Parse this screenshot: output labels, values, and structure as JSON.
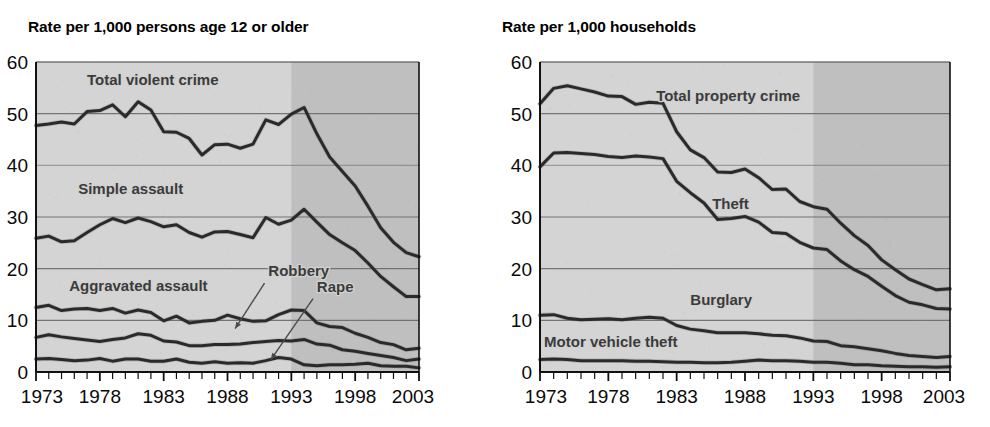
{
  "panels": [
    {
      "id": "left",
      "title": "Rate per 1,000 persons age 12 or older",
      "ylabels": [
        "0",
        "10",
        "20",
        "30",
        "40",
        "50",
        "60"
      ],
      "xlabels": [
        "1973",
        "1978",
        "1983",
        "1988",
        "1993",
        "1998",
        "2003"
      ],
      "series_labels": {
        "total_violent": "Total violent crime",
        "simple_assault": "Simple assault",
        "aggravated_assault": "Aggravated assault",
        "robbery": "Robbery",
        "rape": "Rape"
      }
    },
    {
      "id": "right",
      "title": "Rate per 1,000 households",
      "ylabels": [
        "0",
        "10",
        "20",
        "30",
        "40",
        "50",
        "60"
      ],
      "xlabels": [
        "1973",
        "1978",
        "1983",
        "1988",
        "1993",
        "1998",
        "2003"
      ],
      "series_labels": {
        "total_property": "Total property crime",
        "theft": "Theft",
        "burglary": "Burglary",
        "motor_vehicle_theft": "Motor vehicle theft"
      }
    }
  ],
  "colors": {
    "plot_background": "#d4d4d4",
    "plot_background_shaded": "#bfbfbf",
    "line": "#2a2a2a",
    "gridline": "#6f6f6f",
    "axis": "#111111",
    "label_text": "#3b3b3b",
    "tick_text": "#0a0a0a"
  },
  "chart_data": [
    {
      "type": "line",
      "title": "Rate per 1,000 persons age 12 or older",
      "xlabel": "",
      "ylabel": "Rate per 1,000 persons age 12 or older",
      "xlim": [
        1973,
        2003
      ],
      "ylim": [
        0,
        60
      ],
      "xticks": [
        1973,
        1978,
        1983,
        1988,
        1993,
        1998,
        2003
      ],
      "yticks": [
        0,
        10,
        20,
        30,
        40,
        50,
        60
      ],
      "grid": "horizontal",
      "legend": "inline-annotations",
      "shaded_region": [
        1993,
        2003
      ],
      "x": [
        1973,
        1974,
        1975,
        1976,
        1977,
        1978,
        1979,
        1980,
        1981,
        1982,
        1983,
        1984,
        1985,
        1986,
        1987,
        1988,
        1989,
        1990,
        1991,
        1992,
        1993,
        1994,
        1995,
        1996,
        1997,
        1998,
        1999,
        2000,
        2001,
        2002,
        2003
      ],
      "series": [
        {
          "name": "Total violent crime",
          "values": [
            47.7,
            48.0,
            48.4,
            48.0,
            50.4,
            50.6,
            51.7,
            49.4,
            52.3,
            50.7,
            46.5,
            46.4,
            45.2,
            42.0,
            44.0,
            44.1,
            43.3,
            44.1,
            48.8,
            47.9,
            49.9,
            51.2,
            46.1,
            41.6,
            38.8,
            36.0,
            32.1,
            27.9,
            25.1,
            23.1,
            22.3
          ]
        },
        {
          "name": "Simple assault",
          "values": [
            25.9,
            26.3,
            25.2,
            25.4,
            27.0,
            28.5,
            29.7,
            28.9,
            29.8,
            29.1,
            28.1,
            28.5,
            27.0,
            26.1,
            27.1,
            27.2,
            26.6,
            26.0,
            29.9,
            28.6,
            29.4,
            31.5,
            29.0,
            26.6,
            25.0,
            23.5,
            21.1,
            18.5,
            16.5,
            14.6,
            14.6
          ]
        },
        {
          "name": "Aggravated assault",
          "values": [
            12.5,
            12.9,
            11.9,
            12.2,
            12.3,
            11.9,
            12.3,
            11.4,
            12.0,
            11.5,
            9.9,
            10.8,
            9.5,
            9.8,
            10.0,
            11.0,
            10.3,
            9.8,
            9.9,
            11.1,
            12.0,
            11.9,
            9.5,
            8.8,
            8.6,
            7.5,
            6.7,
            5.7,
            5.3,
            4.3,
            4.6
          ]
        },
        {
          "name": "Robbery",
          "values": [
            6.7,
            7.2,
            6.8,
            6.5,
            6.2,
            5.9,
            6.3,
            6.6,
            7.4,
            7.1,
            6.0,
            5.8,
            5.1,
            5.1,
            5.3,
            5.3,
            5.4,
            5.7,
            5.9,
            6.1,
            6.0,
            6.3,
            5.4,
            5.2,
            4.3,
            4.0,
            3.6,
            3.2,
            2.8,
            2.2,
            2.5
          ]
        },
        {
          "name": "Rape",
          "values": [
            2.5,
            2.6,
            2.4,
            2.2,
            2.3,
            2.6,
            2.1,
            2.5,
            2.5,
            2.1,
            2.1,
            2.5,
            1.9,
            1.7,
            2.0,
            1.7,
            1.8,
            1.7,
            2.2,
            2.8,
            2.5,
            1.4,
            1.2,
            1.4,
            1.4,
            1.5,
            1.7,
            1.2,
            1.1,
            1.1,
            0.8
          ]
        }
      ]
    },
    {
      "type": "line",
      "title": "Rate per 1,000 households",
      "xlabel": "",
      "ylabel": "Rate per 1,000 households",
      "xlim": [
        1973,
        2003
      ],
      "ylim": [
        0,
        60
      ],
      "xticks": [
        1973,
        1978,
        1983,
        1988,
        1993,
        1998,
        2003
      ],
      "yticks": [
        0,
        10,
        20,
        30,
        40,
        50,
        60
      ],
      "grid": "horizontal",
      "legend": "inline-annotations",
      "shaded_region": [
        1993,
        2003
      ],
      "x": [
        1973,
        1974,
        1975,
        1976,
        1977,
        1978,
        1979,
        1980,
        1981,
        1982,
        1983,
        1984,
        1985,
        1986,
        1987,
        1988,
        1989,
        1990,
        1991,
        1992,
        1993,
        1994,
        1995,
        1996,
        1997,
        1998,
        1999,
        2000,
        2001,
        2002,
        2003
      ],
      "series": [
        {
          "name": "Total property crime",
          "values": [
            51.9,
            54.9,
            55.4,
            54.8,
            54.2,
            53.4,
            53.3,
            51.8,
            52.2,
            52.0,
            46.5,
            43.0,
            41.5,
            38.7,
            38.6,
            39.3,
            37.6,
            35.3,
            35.4,
            33.0,
            32.0,
            31.5,
            28.8,
            26.4,
            24.5,
            21.7,
            19.8,
            18.0,
            16.9,
            15.9,
            16.1
          ]
        },
        {
          "name": "Theft",
          "values": [
            39.7,
            42.4,
            42.5,
            42.3,
            42.1,
            41.7,
            41.5,
            41.8,
            41.6,
            41.3,
            36.9,
            34.7,
            32.7,
            29.5,
            29.7,
            30.1,
            29.0,
            27.0,
            26.8,
            25.1,
            24.0,
            23.7,
            21.5,
            19.8,
            18.5,
            16.6,
            14.8,
            13.5,
            13.0,
            12.3,
            12.2
          ]
        },
        {
          "name": "Burglary",
          "values": [
            11.0,
            11.1,
            10.4,
            10.1,
            10.2,
            10.3,
            10.1,
            10.4,
            10.6,
            10.4,
            9.0,
            8.3,
            8.0,
            7.6,
            7.6,
            7.6,
            7.4,
            7.1,
            7.0,
            6.6,
            6.0,
            5.9,
            5.1,
            4.9,
            4.5,
            4.1,
            3.6,
            3.2,
            3.0,
            2.8,
            3.0
          ]
        },
        {
          "name": "Motor vehicle theft",
          "values": [
            2.4,
            2.5,
            2.4,
            2.2,
            2.2,
            2.2,
            2.2,
            2.1,
            2.1,
            2.0,
            1.9,
            1.9,
            1.8,
            1.8,
            1.9,
            2.1,
            2.3,
            2.2,
            2.2,
            2.1,
            1.9,
            1.9,
            1.7,
            1.4,
            1.4,
            1.2,
            1.1,
            1.0,
            1.0,
            0.9,
            1.0
          ]
        }
      ]
    }
  ]
}
